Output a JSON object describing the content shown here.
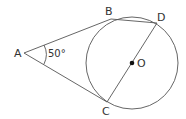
{
  "diagram": {
    "type": "geometry",
    "points": {
      "A": {
        "label": "A",
        "x": 24,
        "y": 53
      },
      "B": {
        "label": "B",
        "x": 111,
        "y": 19
      },
      "C": {
        "label": "C",
        "x": 107,
        "y": 102
      },
      "D": {
        "label": "D",
        "x": 157,
        "y": 23
      },
      "O": {
        "label": "O",
        "x": 132,
        "y": 63
      }
    },
    "circle": {
      "center": "O",
      "radius": 46
    },
    "angle": {
      "vertex": "A",
      "label": "50°"
    },
    "colors": {
      "line": "#555555",
      "text": "#333333"
    }
  }
}
